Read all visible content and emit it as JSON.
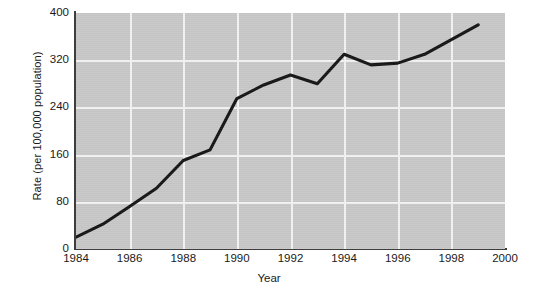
{
  "chart_data": {
    "type": "line",
    "title": "",
    "xlabel": "Year",
    "ylabel": "Rate (per 100,000 population)",
    "xlim": [
      1984,
      2000
    ],
    "ylim": [
      0,
      400
    ],
    "xticks": [
      1984,
      1986,
      1988,
      1990,
      1992,
      1994,
      1996,
      1998,
      2000
    ],
    "xtick_labels": [
      "1984",
      "1986",
      "1988",
      "1990",
      "1992",
      "1994",
      "1996",
      "1998",
      "2000"
    ],
    "yticks": [
      0,
      80,
      160,
      240,
      320,
      400
    ],
    "ytick_labels": [
      "0",
      "80",
      "160",
      "240",
      "320",
      "400"
    ],
    "grid": true,
    "grid_color": "#f2f2f2",
    "plot_background": "#c8c8c8",
    "line_color": "#151515",
    "legend": null,
    "x": [
      1984,
      1985,
      1986,
      1987,
      1988,
      1989,
      1990,
      1991,
      1992,
      1993,
      1994,
      1995,
      1996,
      1997,
      1998,
      1999
    ],
    "values": [
      20,
      42,
      72,
      103,
      150,
      168,
      255,
      278,
      295,
      280,
      330,
      312,
      315,
      330,
      355,
      380
    ],
    "series": [
      {
        "name": "Rate",
        "x": [
          1984,
          1985,
          1986,
          1987,
          1988,
          1989,
          1990,
          1991,
          1992,
          1993,
          1994,
          1995,
          1996,
          1997,
          1998,
          1999
        ],
        "values": [
          20,
          42,
          72,
          103,
          150,
          168,
          255,
          278,
          295,
          280,
          330,
          312,
          315,
          330,
          355,
          380
        ]
      }
    ]
  },
  "axes": {
    "y_title": "Rate (per 100,000 population)",
    "x_title": "Year"
  }
}
